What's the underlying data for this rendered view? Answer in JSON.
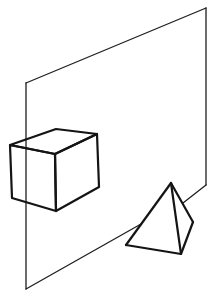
{
  "figure": {
    "colors": {
      "background": "#ffffff",
      "stroke": "#1e1e1e"
    },
    "plane": {
      "top_left": [
        26,
        83
      ],
      "top_right": [
        206,
        8
      ],
      "bottom_right": [
        206,
        185
      ],
      "bottom_left": [
        26,
        289
      ]
    },
    "cube": {
      "top_back": [
        56,
        129
      ],
      "top_right": [
        97,
        134
      ],
      "top_left": [
        10,
        145
      ],
      "top_front": [
        55,
        154
      ],
      "bottom_left": [
        12,
        198
      ],
      "bottom_front": [
        56,
        211
      ],
      "bottom_right": [
        99,
        187
      ]
    },
    "pyramid": {
      "apex": [
        171,
        183
      ],
      "base_left": [
        126,
        245
      ],
      "base_front": [
        181,
        254
      ],
      "base_right": [
        193,
        222
      ]
    }
  }
}
